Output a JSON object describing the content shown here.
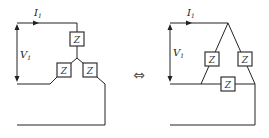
{
  "diagram": {
    "left": {
      "name": "Y network",
      "current_label": {
        "main": "I",
        "sub": "1"
      },
      "voltage_label": {
        "main": "V",
        "sub": "1"
      },
      "impedances": [
        "Z",
        "Z",
        "Z"
      ]
    },
    "equivalence_symbol": "⇔",
    "right": {
      "name": "Δ network",
      "current_label": {
        "main": "I",
        "sub": "1"
      },
      "voltage_label": {
        "main": "V",
        "sub": "1"
      },
      "impedances": [
        "Z",
        "Z",
        "Z"
      ]
    }
  }
}
